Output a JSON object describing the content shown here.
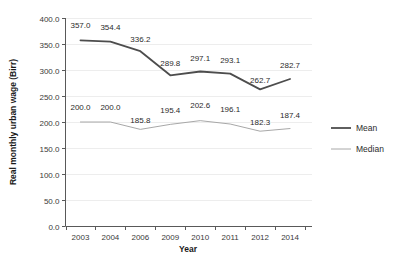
{
  "chart_data": {
    "type": "line",
    "title": "",
    "xlabel": "Year",
    "ylabel": "Real monthly urban wage (Birr)",
    "categories": [
      "2003",
      "2004",
      "2006",
      "2009",
      "2010",
      "2011",
      "2012",
      "2014"
    ],
    "ylim": [
      0,
      400
    ],
    "ytick_labels": [
      "400.0",
      "350.0",
      "300.0",
      "250.0",
      "200.0",
      "150.0",
      "100.0",
      "50.0",
      "0.0"
    ],
    "ytick_values": [
      400,
      350,
      300,
      250,
      200,
      150,
      100,
      50,
      0
    ],
    "grid": true,
    "legend_position": "right",
    "series": [
      {
        "name": "Mean",
        "color": "#4d4d4d",
        "width": 1.8,
        "values": [
          357.0,
          354.4,
          336.2,
          289.8,
          297.1,
          293.1,
          262.7,
          282.7
        ],
        "labels": [
          "357.0",
          "354.4",
          "336.2",
          "289.8",
          "297.1",
          "293.1",
          "262.7",
          "282.7"
        ]
      },
      {
        "name": "Median",
        "color": "#a8a8a8",
        "width": 1.0,
        "values": [
          200.0,
          200.0,
          185.8,
          195.4,
          202.6,
          196.1,
          182.3,
          187.4
        ],
        "labels": [
          "200.0",
          "200.0",
          "185.8",
          "195.4",
          "202.6",
          "196.1",
          "182.3",
          "187.4"
        ]
      }
    ]
  },
  "colors": {
    "mean": "#4d4d4d",
    "median": "#a8a8a8",
    "axis": "#595959",
    "grid": "#ededed",
    "background": "#ffffff"
  }
}
